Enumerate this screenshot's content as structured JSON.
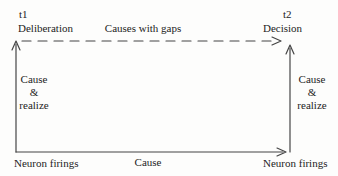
{
  "colors": {
    "background": "#fdfdfc",
    "line": "#454545",
    "text": "#232323"
  },
  "diagram": {
    "timeline": {
      "start": "t1",
      "end": "t2"
    },
    "nodes": {
      "top_left": "Deliberation",
      "top_right": "Decision",
      "bottom_left": "Neuron firings",
      "bottom_right": "Neuron firings"
    },
    "edges": {
      "top": "Causes with gaps",
      "bottom": "Cause",
      "left": {
        "line1": "Cause",
        "line2": "&",
        "line3": "realize"
      },
      "right": {
        "line1": "Cause",
        "line2": "&",
        "line3": "realize"
      }
    }
  }
}
